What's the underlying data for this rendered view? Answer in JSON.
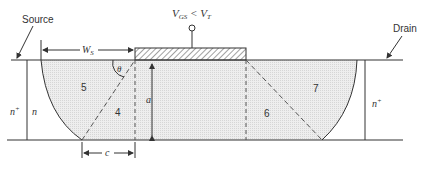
{
  "diagram": {
    "labels": {
      "source": "Source",
      "drain": "Drain",
      "gate_voltage_main": "V",
      "gate_voltage_sub1": "GS",
      "gate_voltage_rel": " < V",
      "gate_voltage_sub2": "T",
      "ws_main": "W",
      "ws_sub": "S",
      "theta": "θ",
      "a": "a",
      "c": "c",
      "n_plus_left": "n",
      "n_plus_left_sup": "+",
      "n_left": "n",
      "n_plus_right": "n",
      "n_plus_right_sup": "+"
    },
    "regions": [
      {
        "id": "4",
        "label": "4"
      },
      {
        "id": "5",
        "label": "5"
      },
      {
        "id": "6",
        "label": "6"
      },
      {
        "id": "7",
        "label": "7"
      }
    ],
    "colors": {
      "line": "#333333",
      "depletion_fill": "#e6e6e6",
      "gate_hatch": "#444444"
    }
  }
}
